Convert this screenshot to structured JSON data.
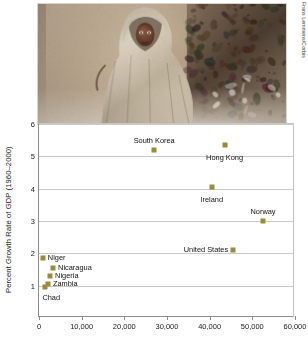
{
  "photo": {
    "alt_description": "child wrapped in a dusty blanket standing beside a mud wall",
    "credit": "Frans Lemmens/Corbis"
  },
  "chart_data": {
    "type": "scatter",
    "title": "",
    "xlabel": "",
    "ylabel": "Percent Growth Rate of GDP (1960–2000)",
    "xlim": [
      0,
      60000
    ],
    "ylim": [
      0,
      6
    ],
    "grid": true,
    "legend": "none",
    "marker_color": "#9b8a3b",
    "xticks": [
      {
        "value": 0,
        "label": "0"
      },
      {
        "value": 10000,
        "label": "10,000"
      },
      {
        "value": 20000,
        "label": "20,000"
      },
      {
        "value": 30000,
        "label": "30,000"
      },
      {
        "value": 40000,
        "label": "40,000"
      },
      {
        "value": 50000,
        "label": "50,000"
      },
      {
        "value": 60000,
        "label": "60,000"
      }
    ],
    "yticks": [
      {
        "value": 1,
        "label": "1"
      },
      {
        "value": 2,
        "label": "2"
      },
      {
        "value": 3,
        "label": "3"
      },
      {
        "value": 4,
        "label": "4"
      },
      {
        "value": 5,
        "label": "5"
      },
      {
        "value": 6,
        "label": "6"
      }
    ],
    "points": [
      {
        "name": "South Korea",
        "x": 27000,
        "y": 5.2,
        "label": "South Korea",
        "label_pos": "above"
      },
      {
        "name": "Hong Kong",
        "x": 43500,
        "y": 5.35,
        "label": "Hong Kong",
        "label_pos": "below"
      },
      {
        "name": "Ireland",
        "x": 40500,
        "y": 4.05,
        "label": "Ireland",
        "label_pos": "below"
      },
      {
        "name": "Norway",
        "x": 52500,
        "y": 3.0,
        "label": "Norway",
        "label_pos": "above"
      },
      {
        "name": "United States",
        "x": 45500,
        "y": 2.1,
        "label": "United States",
        "label_pos": "left"
      },
      {
        "name": "Niger",
        "x": 900,
        "y": 1.85,
        "label": "Niger",
        "label_pos": "right"
      },
      {
        "name": "Nicaragua",
        "x": 3300,
        "y": 1.55,
        "label": "Nicaragua",
        "label_pos": "right"
      },
      {
        "name": "Nigeria",
        "x": 2600,
        "y": 1.3,
        "label": "Nigeria",
        "label_pos": "right"
      },
      {
        "name": "Zambia",
        "x": 2100,
        "y": 1.05,
        "label": "Zambia",
        "label_pos": "right"
      },
      {
        "name": "Chad",
        "x": 1500,
        "y": 0.95,
        "label": "Chad",
        "label_pos": "below-left"
      }
    ]
  }
}
